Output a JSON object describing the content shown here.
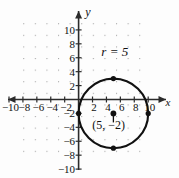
{
  "figure": {
    "axis_labels": {
      "x": "x",
      "y": "y"
    },
    "annotations": {
      "radius_label": "r = 5",
      "center_label": "(5, −2)"
    },
    "x_tick_labels": [
      "−10",
      "−8",
      "−6",
      "−4",
      "−2",
      "2",
      "4",
      "6",
      "8",
      "10"
    ],
    "y_tick_labels": [
      "10",
      "8",
      "6",
      "4",
      "2",
      "−2",
      "−4",
      "−6",
      "−8",
      "−10"
    ],
    "colors": {
      "ink": "#1a1a1a",
      "grid": "#9a9a9a",
      "axis": "#2b2b2b"
    }
  },
  "chart_data": {
    "type": "scatter",
    "title": "",
    "xlabel": "x",
    "ylabel": "y",
    "xlim": [
      -11,
      11
    ],
    "ylim": [
      -11,
      11
    ],
    "grid": true,
    "grid_step": 1,
    "legend": "none",
    "x_ticks": [
      -10,
      -8,
      -6,
      -4,
      -2,
      2,
      4,
      6,
      8,
      10
    ],
    "y_ticks": [
      10,
      8,
      6,
      4,
      2,
      -2,
      -4,
      -6,
      -8,
      -10
    ],
    "shapes": [
      {
        "kind": "circle",
        "center": [
          5,
          -2
        ],
        "radius": 5,
        "equation": "(x − 5)² + (y + 2)² = 25",
        "stroke": "#111111",
        "fill": "none"
      }
    ],
    "points": [
      {
        "label": "center",
        "x": 5,
        "y": -2,
        "marked": true,
        "text": "(5, −2)"
      },
      {
        "label": "top",
        "x": 5,
        "y": 3,
        "marked": true
      },
      {
        "label": "bottom",
        "x": 5,
        "y": -7,
        "marked": true
      },
      {
        "label": "left",
        "x": 0,
        "y": -2,
        "marked": true
      },
      {
        "label": "right",
        "x": 10,
        "y": -2,
        "marked": true
      }
    ],
    "annotations": [
      {
        "text": "r = 5",
        "x": 5.2,
        "y": 6.2
      },
      {
        "text": "(5, −2)",
        "x": 4.3,
        "y": -4.3
      }
    ]
  }
}
